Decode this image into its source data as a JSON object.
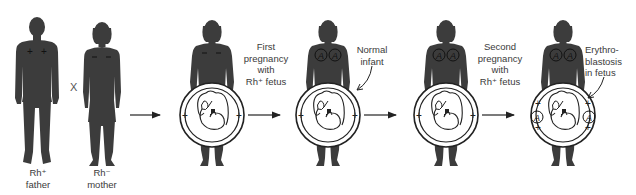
{
  "diagram": {
    "type": "process-flow",
    "topic": "Rh incompatibility inheritance",
    "colors": {
      "silhouette": "#3c3c3c",
      "line": "#222222",
      "background": "#ffffff",
      "text": "#3a3a3a"
    },
    "parents": {
      "father": {
        "label_line1": "Rh⁺",
        "label_line2": "father",
        "chest_marks": "+ +"
      },
      "cross_symbol": "X",
      "mother": {
        "label_line1": "Rh⁻",
        "label_line2": "mother",
        "chest_marks": "– –"
      }
    },
    "stages": [
      {
        "id": "pregnant-mother-1",
        "mother_marks": "– –",
        "fetus_marks": [
          "+",
          "+"
        ],
        "antibodies": 0
      },
      {
        "id": "pregnant-mother-2",
        "mother_marks": "A A",
        "fetus_marks": [
          "+",
          "+"
        ],
        "antibodies": 2
      },
      {
        "id": "pregnant-mother-3",
        "mother_marks": "A A",
        "fetus_marks": [
          "+",
          "+"
        ],
        "antibodies": 2
      },
      {
        "id": "pregnant-mother-4",
        "mother_marks": "A A",
        "fetus_marks": [
          "+",
          "+",
          "+",
          "+",
          "A",
          "A"
        ],
        "antibodies": 4
      }
    ],
    "labels": {
      "first_pregnancy": [
        "First",
        "pregnancy",
        "with",
        "Rh⁺ fetus"
      ],
      "normal_infant": [
        "Normal",
        "infant"
      ],
      "second_pregnancy": [
        "Second",
        "pregnancy",
        "with",
        "Rh⁺ fetus"
      ],
      "erythroblastosis": [
        "Erythro-",
        "blastosis",
        "in fetus"
      ]
    },
    "antibody_symbol": "A",
    "arrows": 4
  }
}
